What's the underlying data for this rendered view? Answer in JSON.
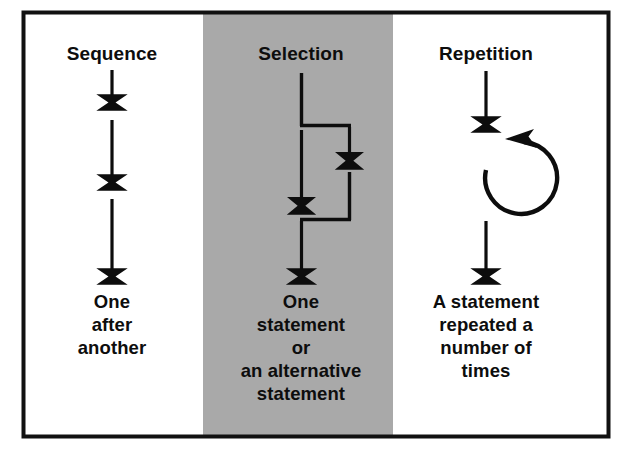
{
  "figure": {
    "kind": "control-structures-diagram",
    "background_color": "#ffffff",
    "border_color": "#111111",
    "highlight_band_color": "#a9a9a9",
    "ink_color": "#0d0d0d"
  },
  "columns": [
    {
      "id": "sequence",
      "title": "Sequence",
      "highlighted": false,
      "caption_lines": [
        "One",
        "after",
        "another"
      ],
      "structure": "three stacked down-arrows in a straight vertical line"
    },
    {
      "id": "selection",
      "title": "Selection",
      "highlighted": true,
      "caption_lines": [
        "One",
        "statement",
        "or",
        "an alternative",
        "statement"
      ],
      "structure": "vertical line splits into two parallel branches, each ending in a down-arrow, then merges back into a single down-arrow"
    },
    {
      "id": "repetition",
      "title": "Repetition",
      "highlighted": false,
      "caption_lines": [
        "A statement",
        "repeated a",
        "number of",
        "times"
      ],
      "structure": "down-arrow into a circular loop arrow that returns to the top, then continues down"
    }
  ]
}
